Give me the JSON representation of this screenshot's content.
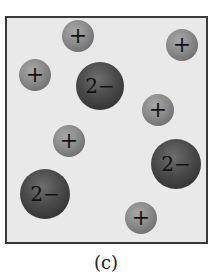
{
  "figure": {
    "caption": "(c)",
    "colors": {
      "box_border": "#3a3a3a",
      "box_fill": "#e9e9e9",
      "cation": "#8a8a8a",
      "anion": "#4a4a4a"
    },
    "ions": [
      {
        "type": "cation",
        "label": "+",
        "cx": 78,
        "cy": 36,
        "r": 16
      },
      {
        "type": "cation",
        "label": "+",
        "cx": 182,
        "cy": 45,
        "r": 16
      },
      {
        "type": "cation",
        "label": "+",
        "cx": 35,
        "cy": 75,
        "r": 16
      },
      {
        "type": "anion",
        "label": "2−",
        "cx": 100,
        "cy": 86,
        "r": 24
      },
      {
        "type": "cation",
        "label": "+",
        "cx": 158,
        "cy": 110,
        "r": 16
      },
      {
        "type": "cation",
        "label": "+",
        "cx": 69,
        "cy": 141,
        "r": 16
      },
      {
        "type": "anion",
        "label": "2−",
        "cx": 176,
        "cy": 164,
        "r": 25
      },
      {
        "type": "anion",
        "label": "2−",
        "cx": 45,
        "cy": 194,
        "r": 25
      },
      {
        "type": "cation",
        "label": "+",
        "cx": 141,
        "cy": 218,
        "r": 16
      }
    ]
  }
}
